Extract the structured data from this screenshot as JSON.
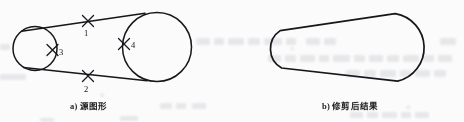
{
  "page": {
    "background_color": "#fbfbfb",
    "ink_color": "#15151a",
    "width": 464,
    "height": 122
  },
  "figures": [
    {
      "id": "source-figure",
      "caption": "a) 源图形",
      "caption_x": 70,
      "caption_y": 99,
      "description": "Two circles (small left pulley, large right pulley) joined by two external tangent lines, with four X-shaped intersection markers labelled 1 to 4.",
      "small_circle": {
        "cx": 35,
        "cy": 48.5,
        "r": 22
      },
      "large_circle": {
        "cx": 157,
        "cy": 47,
        "r": 34.5
      },
      "tangents": [
        {
          "name": "upper-tangent",
          "x1": 22,
          "y1": 29,
          "x2": 143,
          "y2": 13.5
        },
        {
          "name": "lower-tangent",
          "x1": 24,
          "y1": 68.5,
          "x2": 146,
          "y2": 80.5
        }
      ],
      "markers": [
        {
          "label": "1",
          "x": 88,
          "y": 21,
          "label_x": 88,
          "label_y": 33,
          "on": "upper-tangent"
        },
        {
          "label": "2",
          "x": 88,
          "y": 76,
          "label_x": 88,
          "label_y": 90,
          "on": "lower-tangent"
        },
        {
          "label": "3",
          "x": 52,
          "y": 50,
          "label_x": 60,
          "label_y": 54,
          "on": "small-circle"
        },
        {
          "label": "4",
          "x": 124,
          "y": 44,
          "label_x": 133,
          "label_y": 47,
          "on": "large-circle"
        }
      ]
    },
    {
      "id": "trimmed-figure",
      "caption": "b) 修剪后结果",
      "caption_x": 322,
      "caption_y": 99,
      "description": "The resulting closed belt outline after trimming away the inner circle arcs.",
      "left_arc": {
        "cx": 293,
        "cy": 49.5,
        "r": 22
      },
      "right_arc": {
        "cx": 409,
        "cy": 48,
        "r": 34.5
      },
      "tangents": [
        {
          "name": "upper-tangent",
          "x1": 280,
          "y1": 30,
          "x2": 395,
          "y2": 14
        },
        {
          "name": "lower-tangent",
          "x1": 282,
          "y1": 69,
          "x2": 398,
          "y2": 81.5
        }
      ]
    }
  ],
  "ghost_text": {
    "note": "faint bleed-through text from the reverse page, illegible",
    "lines": [
      {
        "x": 196,
        "y": 40,
        "width": 120,
        "height": 7
      },
      {
        "x": 300,
        "y": 56,
        "width": 150,
        "height": 7
      },
      {
        "x": 268,
        "y": 70,
        "width": 170,
        "height": 7
      },
      {
        "x": 160,
        "y": 104,
        "width": 70,
        "height": 6
      },
      {
        "x": 350,
        "y": 112,
        "width": 90,
        "height": 6
      }
    ]
  }
}
